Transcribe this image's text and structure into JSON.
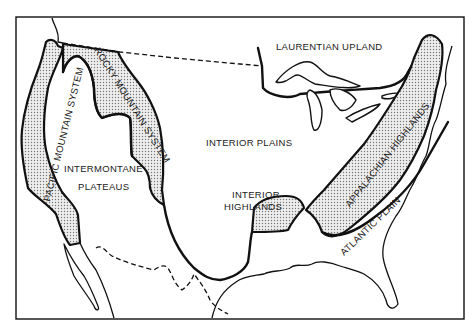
{
  "map": {
    "title": "Physiographic regions of the United States",
    "colors": {
      "ink": "#111111",
      "background": "#ffffff",
      "shading": "#bdbdbd"
    },
    "regions": [
      {
        "id": "laurentian-upland",
        "label": "LAURENTIAN UPLAND",
        "shaded": false
      },
      {
        "id": "interior-plains",
        "label": "INTERIOR PLAINS",
        "shaded": false
      },
      {
        "id": "intermontane-plateaus",
        "label_line1": "INTERMONTANE",
        "label_line2": "PLATEAUS",
        "shaded": false
      },
      {
        "id": "interior-highlands",
        "label_line1": "INTERIOR",
        "label_line2": "HIGHLANDS",
        "shaded": true
      },
      {
        "id": "pacific-mountain-system",
        "label": "PACIFIC MOUNTAIN SYSTEM",
        "shaded": true
      },
      {
        "id": "rocky-mountain-system",
        "label": "ROCKY MOUNTAIN SYSTEM",
        "shaded": true
      },
      {
        "id": "appalachian-highlands",
        "label": "APPALACHIAN HIGHLANDS",
        "shaded": true
      },
      {
        "id": "atlantic-plain",
        "label": "ATLANTIC PLAIN",
        "shaded": false
      }
    ],
    "labels": {
      "laurentian": "LAURENTIAN UPLAND",
      "interior_plains": "INTERIOR PLAINS",
      "intermontane_1": "INTERMONTANE",
      "intermontane_2": "PLATEAUS",
      "interior_highlands_1": "INTERIOR",
      "interior_highlands_2": "HIGHLANDS",
      "pacific": "PACIFIC MOUNTAIN SYSTEM",
      "rocky": "ROCKY MOUNTAIN SYSTEM",
      "appalachian": "APPALACHIAN HIGHLANDS",
      "atlantic": "ATLANTIC PLAIN"
    }
  }
}
